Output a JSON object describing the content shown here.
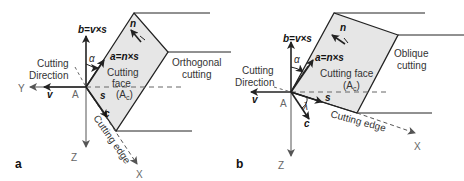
{
  "panels": [
    {
      "id": "a",
      "panel_label": "a",
      "title": "Orthogonal cutting",
      "title_line1": "Orthogonal",
      "title_line2": "cutting",
      "face_line1": "Cutting",
      "face_line2": "face",
      "face_line3": "(A",
      "face_sub": "c",
      "face_close": ")",
      "vec_b": "b=v×s",
      "vec_a": "a=n×s",
      "vec_n": "n",
      "vec_v": "v",
      "vec_s": "s",
      "vec_c": "c",
      "angle_alpha": "α",
      "point": "A",
      "cutting_direction_1": "Cutting",
      "cutting_direction_2": "Direction",
      "cutting_edge": "Cutting edge",
      "axis_x": "X",
      "axis_y": "Y",
      "axis_z": "Z"
    },
    {
      "id": "b",
      "panel_label": "b",
      "title": "Oblique cutting",
      "title_line1": "Oblique",
      "title_line2": "cutting",
      "face_line1": "Cutting face",
      "face_line3": "(A",
      "face_sub": "c",
      "face_close": ")",
      "vec_b": "b=v×s",
      "vec_a": "a=n×s",
      "vec_n": "n",
      "vec_v": "v",
      "vec_s": "s",
      "vec_c": "c",
      "angle_alpha": "α",
      "angle_lambda": "λ",
      "point": "A",
      "cutting_direction_1": "Cutting",
      "cutting_direction_2": "Direction",
      "cutting_edge": "Cutting edge",
      "axis_x": "X",
      "axis_z": "Z"
    }
  ],
  "colors": {
    "face_fill": "#e6e6e6",
    "line": "#222222",
    "axis": "#555555"
  }
}
